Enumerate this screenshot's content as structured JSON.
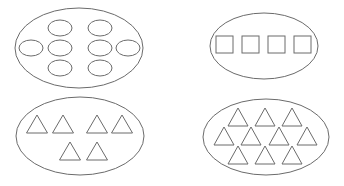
{
  "diagram": {
    "stroke_color": "#6b6b6b",
    "background": "#ffffff",
    "sets": [
      {
        "id": "set-ovals",
        "shape": "oval",
        "count": 8,
        "container": {
          "cx": 79,
          "cy": 48,
          "rx": 64,
          "ry": 40
        },
        "items": [
          {
            "cx": 60,
            "cy": 28
          },
          {
            "cx": 100,
            "cy": 28
          },
          {
            "cx": 31,
            "cy": 48
          },
          {
            "cx": 60,
            "cy": 48
          },
          {
            "cx": 100,
            "cy": 48
          },
          {
            "cx": 128,
            "cy": 48
          },
          {
            "cx": 60,
            "cy": 68
          },
          {
            "cx": 100,
            "cy": 68
          }
        ],
        "item_size": {
          "rx": 12,
          "ry": 8
        }
      },
      {
        "id": "set-squares",
        "shape": "square",
        "count": 4,
        "container": {
          "cx": 264,
          "cy": 46,
          "rx": 54,
          "ry": 33
        },
        "items": [
          {
            "x": 216,
            "y": 36
          },
          {
            "x": 242,
            "y": 36
          },
          {
            "x": 268,
            "y": 36
          },
          {
            "x": 294,
            "y": 36
          }
        ],
        "item_size": {
          "w": 17,
          "h": 17
        }
      },
      {
        "id": "set-triangles-6",
        "shape": "triangle",
        "count": 6,
        "container": {
          "cx": 80,
          "cy": 136,
          "rx": 64,
          "ry": 39
        },
        "items": [
          {
            "cx": 37,
            "top": 115
          },
          {
            "cx": 63,
            "top": 115
          },
          {
            "cx": 97,
            "top": 115
          },
          {
            "cx": 122,
            "top": 115
          },
          {
            "cx": 70,
            "top": 142
          },
          {
            "cx": 97,
            "top": 142
          }
        ],
        "item_size": {
          "w": 21,
          "h": 18
        }
      },
      {
        "id": "set-triangles-10",
        "shape": "triangle",
        "count": 10,
        "container": {
          "cx": 266,
          "cy": 137,
          "rx": 63,
          "ry": 38
        },
        "items": [
          {
            "cx": 238,
            "top": 108
          },
          {
            "cx": 265,
            "top": 108
          },
          {
            "cx": 292,
            "top": 108
          },
          {
            "cx": 224,
            "top": 127
          },
          {
            "cx": 251,
            "top": 127
          },
          {
            "cx": 279,
            "top": 127
          },
          {
            "cx": 307,
            "top": 127
          },
          {
            "cx": 238,
            "top": 146
          },
          {
            "cx": 265,
            "top": 146
          },
          {
            "cx": 292,
            "top": 146
          }
        ],
        "item_size": {
          "w": 20,
          "h": 18
        }
      }
    ]
  }
}
